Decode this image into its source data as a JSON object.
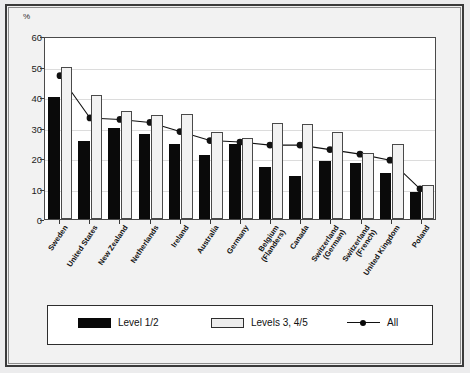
{
  "chart_data": {
    "type": "bar",
    "title": "",
    "subtitle": "",
    "xlabel": "",
    "ylabel": "%",
    "ylim": [
      0,
      60
    ],
    "yticks": [
      0,
      10,
      20,
      30,
      40,
      50,
      60
    ],
    "grid": true,
    "legend_position": "bottom",
    "categories": [
      "Sweden",
      "United States",
      "New Zealand",
      "Netherlands",
      "Ireland",
      "Australia",
      "Germany",
      "Belgium (Flanders)",
      "Canada",
      "Switzerland (German)",
      "Switzerland (French)",
      "United Kingdom",
      "Poland"
    ],
    "category_lines": [
      [
        "Sweden"
      ],
      [
        "United States"
      ],
      [
        "New Zealand"
      ],
      [
        "Netherlands"
      ],
      [
        "Ireland"
      ],
      [
        "Australia"
      ],
      [
        "Germany"
      ],
      [
        "Belgium",
        "(Flanders)"
      ],
      [
        "Canada"
      ],
      [
        "Switzerland",
        "(German)"
      ],
      [
        "Switzerland",
        "(French)"
      ],
      [
        "United Kingdom"
      ],
      [
        "Poland"
      ]
    ],
    "series": [
      {
        "name": "Level 1/2",
        "kind": "bar",
        "color": "#080808",
        "values": [
          40.0,
          25.5,
          30.0,
          28.0,
          24.5,
          21.0,
          24.5,
          17.0,
          14.0,
          19.0,
          18.5,
          15.0,
          9.0
        ]
      },
      {
        "name": "Levels 3, 4/5",
        "kind": "bar",
        "color": "#f2f2f2",
        "values": [
          50.0,
          40.5,
          35.5,
          34.0,
          34.5,
          28.5,
          26.5,
          31.5,
          31.0,
          28.5,
          21.5,
          24.5,
          11.0
        ]
      },
      {
        "name": "All",
        "kind": "line",
        "color": "#111111",
        "values": [
          47.5,
          33.5,
          33.0,
          32.0,
          29.0,
          26.0,
          25.5,
          24.5,
          24.5,
          23.0,
          21.5,
          19.5,
          10.0
        ]
      }
    ]
  },
  "legend": {
    "items": [
      {
        "label": "Level 1/2",
        "marker": "dark-square-swatch"
      },
      {
        "label": "Levels 3, 4/5",
        "marker": "light-square-swatch"
      },
      {
        "label": "All",
        "marker": "line-with-dot-marker"
      }
    ]
  }
}
